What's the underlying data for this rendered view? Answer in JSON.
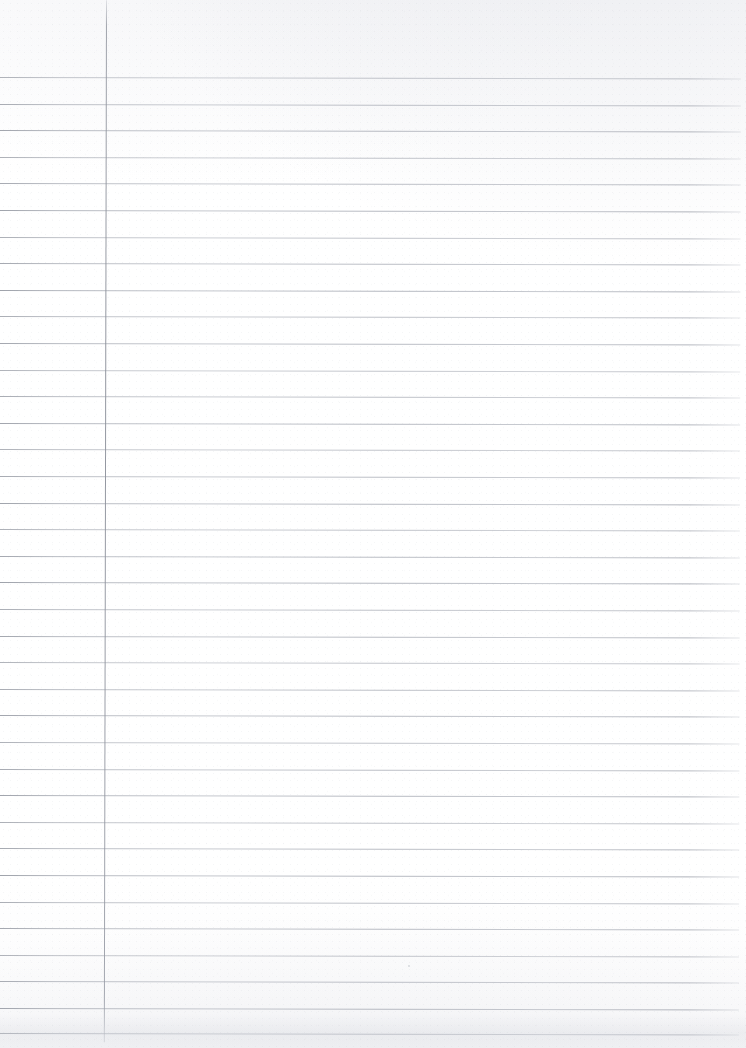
{
  "document": {
    "kind": "scanned-blank-ruled-notebook-page",
    "title": "",
    "visible_text": "",
    "page_width": 746,
    "page_height": 1048,
    "background_color": "#fdfdfe",
    "rule_color": "#a3a7b0",
    "margin_line_color": "#8e929c"
  },
  "ruling": {
    "style": "wide-ruled horizontal lines with single vertical left margin",
    "first_line_y": 77,
    "line_spacing": 26.6,
    "line_count": 37,
    "line_start_x": 0,
    "line_end_x": 741,
    "line_thickness": 1,
    "skew_degrees": 0.12,
    "rule_y_positions": [
      77,
      103.6,
      130.2,
      156.8,
      183.4,
      210,
      236.6,
      263.2,
      289.8,
      316.4,
      343,
      369.6,
      396.2,
      422.8,
      449.4,
      476,
      502.6,
      529.2,
      555.8,
      582.4,
      609,
      635.6,
      662.2,
      688.8,
      715.4,
      742,
      768.6,
      795.2,
      821.8,
      848.4,
      875,
      901.6,
      928.2,
      954.8,
      981.4,
      1008,
      1032.6
    ]
  },
  "margin": {
    "name": "left-margin-rule",
    "x": 106,
    "top_y": 0,
    "bottom_y": 1042,
    "thickness": 1
  },
  "artifacts": {
    "speck": {
      "x": 408,
      "y": 965,
      "size": 2
    },
    "bottom_shadow": {
      "y": 1014,
      "height": 34
    }
  }
}
